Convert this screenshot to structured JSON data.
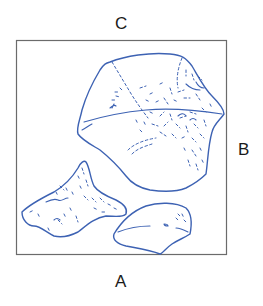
{
  "diagram": {
    "labels": {
      "top": "C",
      "right": "B",
      "bottom": "A"
    },
    "frame": {
      "x": 16,
      "y": 40,
      "width": 210,
      "height": 214
    },
    "shapes": [
      {
        "name": "large-fragment",
        "description": "large rounded fragment in upper right with stippled texture"
      },
      {
        "name": "triangular-fragment",
        "description": "triangular fragment in lower left with stippled texture"
      },
      {
        "name": "small-fragment",
        "description": "small elongated fragment at bottom center"
      }
    ],
    "colors": {
      "outline": "#3d62b3",
      "frame": "#6b6b6b",
      "label": "#1a1a1a"
    }
  }
}
